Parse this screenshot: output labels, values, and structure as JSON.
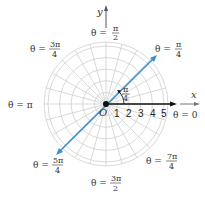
{
  "diagram": {
    "type": "polar-grid",
    "center": {
      "x": 106,
      "y": 104
    },
    "unit_px": 11.6,
    "circles": [
      1,
      2,
      3,
      4,
      5
    ],
    "outer_radius_px": 62,
    "radial_spoke_step_deg": 15,
    "colors": {
      "grid": "#cfcfcf",
      "axis": "#555555",
      "ray_theta0": "#111111",
      "ray_pi4": "#3a8fcf"
    },
    "axes": {
      "x_label": "x",
      "y_label": "y",
      "origin_label": "O"
    },
    "radial_ticks": [
      "1",
      "2",
      "3",
      "4",
      "5"
    ],
    "angle_marker": {
      "num": "π",
      "den": "4"
    },
    "theta_labels": [
      {
        "id": "0",
        "text": "θ = 0"
      },
      {
        "id": "pi4",
        "prefix": "θ = ",
        "num": "π",
        "den": "4"
      },
      {
        "id": "pi2",
        "prefix": "θ = ",
        "num": "π",
        "den": "2"
      },
      {
        "id": "3pi4",
        "prefix": "θ = ",
        "num": "3π",
        "den": "4"
      },
      {
        "id": "pi",
        "text": "θ = π"
      },
      {
        "id": "5pi4",
        "prefix": "θ = ",
        "num": "5π",
        "den": "4"
      },
      {
        "id": "3pi2",
        "prefix": "θ = ",
        "num": "3π",
        "den": "2"
      },
      {
        "id": "7pi4",
        "prefix": "θ = ",
        "num": "7π",
        "den": "4"
      }
    ]
  }
}
